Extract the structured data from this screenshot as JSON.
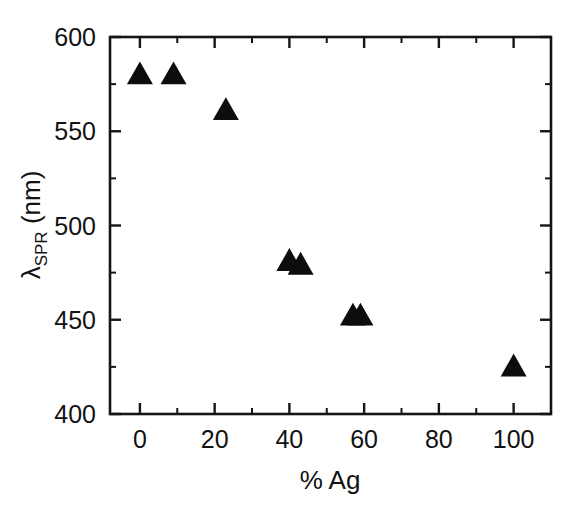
{
  "chart_data": {
    "type": "scatter",
    "title": "",
    "subtitle": "",
    "xlabel": "% Ag",
    "ylabel": "λSPR (nm)",
    "ylabel_base": "λ",
    "ylabel_subscript": "SPR",
    "ylabel_unit": " (nm)",
    "xlim": [
      -8,
      110
    ],
    "ylim": [
      400,
      600
    ],
    "x_major_ticks": [
      0,
      20,
      40,
      60,
      80,
      100
    ],
    "x_minor_ticks": [
      10,
      30,
      50,
      70,
      90
    ],
    "y_major_ticks": [
      400,
      450,
      500,
      550,
      600
    ],
    "y_minor_ticks": [
      425,
      475,
      525,
      575
    ],
    "x_tick_labels": [
      "0",
      "20",
      "40",
      "60",
      "80",
      "100"
    ],
    "y_tick_labels": [
      "400",
      "450",
      "500",
      "550",
      "600"
    ],
    "grid": false,
    "legend": false,
    "legend_position": "none",
    "marker_shape": "triangle-up",
    "marker_color": "#0d0d0d",
    "marker_size": 26,
    "series": [
      {
        "name": "SPR peak wavelength",
        "points": [
          {
            "x": 0,
            "y": 580
          },
          {
            "x": 9,
            "y": 580
          },
          {
            "x": 23,
            "y": 561
          },
          {
            "x": 40,
            "y": 481
          },
          {
            "x": 43,
            "y": 479
          },
          {
            "x": 57,
            "y": 452
          },
          {
            "x": 59,
            "y": 452
          },
          {
            "x": 100,
            "y": 425
          }
        ]
      }
    ]
  },
  "figure": {
    "background_color": "#ffffff",
    "axis_color": "#151515",
    "text_color": "#121212"
  }
}
